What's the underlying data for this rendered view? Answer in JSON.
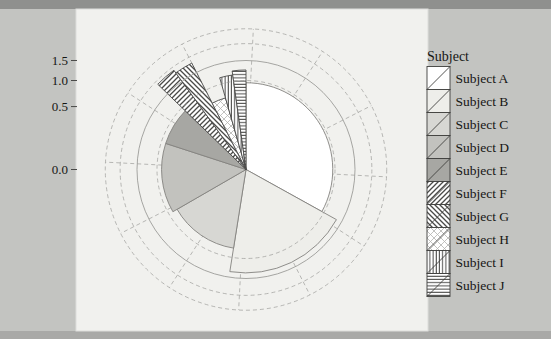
{
  "page": {
    "background": "#c3c4c1",
    "top_band": "#8f908e",
    "bottom_band": "#a9a9a7",
    "panel": "#f1f1ee",
    "grid_color": "#9c9c99"
  },
  "chart_data": {
    "type": "pie",
    "variant": "polar rose / coxcomb: wedge radius encodes value on a square-root radial scale",
    "title": "",
    "radial_axis": {
      "scale": "sqrt",
      "tick_labels": [
        "1.5",
        "1.0",
        "0.5",
        "0.0"
      ],
      "tick_values": [
        1.5,
        1.0,
        0.5,
        0.0
      ],
      "gridline_values": [
        0.5,
        1.0,
        1.5,
        2.0,
        2.5
      ],
      "solid_circle_value": 1.5,
      "spoke_step_deg": 30,
      "spoke_offset_deg": 3,
      "range": [
        0,
        2.5
      ]
    },
    "legend": {
      "title": "Subject",
      "position": "right"
    },
    "series": [
      {
        "label": "Subject A",
        "value": 0.95,
        "start_deg": 0,
        "end_deg": 119,
        "pattern": "solid",
        "fill": "#ffffff"
      },
      {
        "label": "Subject B",
        "value": 1.35,
        "start_deg": 119,
        "end_deg": 189,
        "pattern": "solid",
        "fill": "#eeeeea"
      },
      {
        "label": "Subject C",
        "value": 0.8,
        "start_deg": 189,
        "end_deg": 240,
        "pattern": "solid",
        "fill": "#d7d7d3"
      },
      {
        "label": "Subject D",
        "value": 0.9,
        "start_deg": 240,
        "end_deg": 288,
        "pattern": "solid",
        "fill": "#c2c2be"
      },
      {
        "label": "Subject E",
        "value": 0.9,
        "start_deg": 288,
        "end_deg": 314,
        "pattern": "solid",
        "fill": "#a7a7a3"
      },
      {
        "label": "Subject F",
        "value": 1.9,
        "start_deg": 314,
        "end_deg": 324,
        "pattern": "diag-up",
        "fill": "#ffffff"
      },
      {
        "label": "Subject G",
        "value": 1.8,
        "start_deg": 324,
        "end_deg": 333,
        "pattern": "diag-down",
        "fill": "#ffffff"
      },
      {
        "label": "Subject H",
        "value": 0.7,
        "start_deg": 333,
        "end_deg": 344,
        "pattern": "cross-light",
        "fill": "#ffffff"
      },
      {
        "label": "Subject I",
        "value": 1.15,
        "start_deg": 344,
        "end_deg": 352,
        "pattern": "vertical",
        "fill": "#ffffff"
      },
      {
        "label": "Subject J",
        "value": 1.25,
        "start_deg": 352,
        "end_deg": 360,
        "pattern": "horizontal",
        "fill": "#ffffff"
      }
    ]
  }
}
